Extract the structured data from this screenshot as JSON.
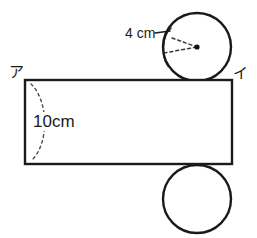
{
  "figure": {
    "canvas": {
      "width": 257,
      "height": 238,
      "background": "#ffffff"
    },
    "stroke_color": "#1a1a1a",
    "dimension_color": "#3b3b3b"
  },
  "labels": {
    "corner_left": "ア",
    "corner_right": "イ",
    "radius": "4 cm",
    "height": "10cm"
  },
  "shapes": {
    "rectangle": {
      "name": "lateral-face-rectangle",
      "x": 25,
      "y": 80,
      "width": 207,
      "height": 84,
      "fill": "#ffffff",
      "stroke": "#1a1a1a"
    },
    "circle_top": {
      "name": "top-base-circle",
      "cx": 197,
      "cy": 47,
      "r": 34,
      "fill": "#ffffff",
      "stroke": "#1a1a1a"
    },
    "circle_bottom": {
      "name": "bottom-base-circle",
      "cx": 197,
      "cy": 199,
      "r": 34,
      "fill": "#ffffff",
      "stroke": "#1a1a1a"
    },
    "center_dot": {
      "name": "circle-center-point",
      "cx": 197,
      "cy": 47,
      "r": 2.6
    }
  },
  "annotations": {
    "radius_wedge": {
      "name": "radius-dimension-wedge",
      "from_x": 165,
      "from_y": 52,
      "to_x": 197,
      "to_y": 47,
      "upper_from_x": 170,
      "upper_from_y": 38
    },
    "height_brace": {
      "name": "height-dimension-brace",
      "top_x": 30,
      "top_y": 84,
      "bottom_x": 30,
      "bottom_y": 160,
      "bulge_x": 52,
      "bulge_y": 122
    }
  }
}
